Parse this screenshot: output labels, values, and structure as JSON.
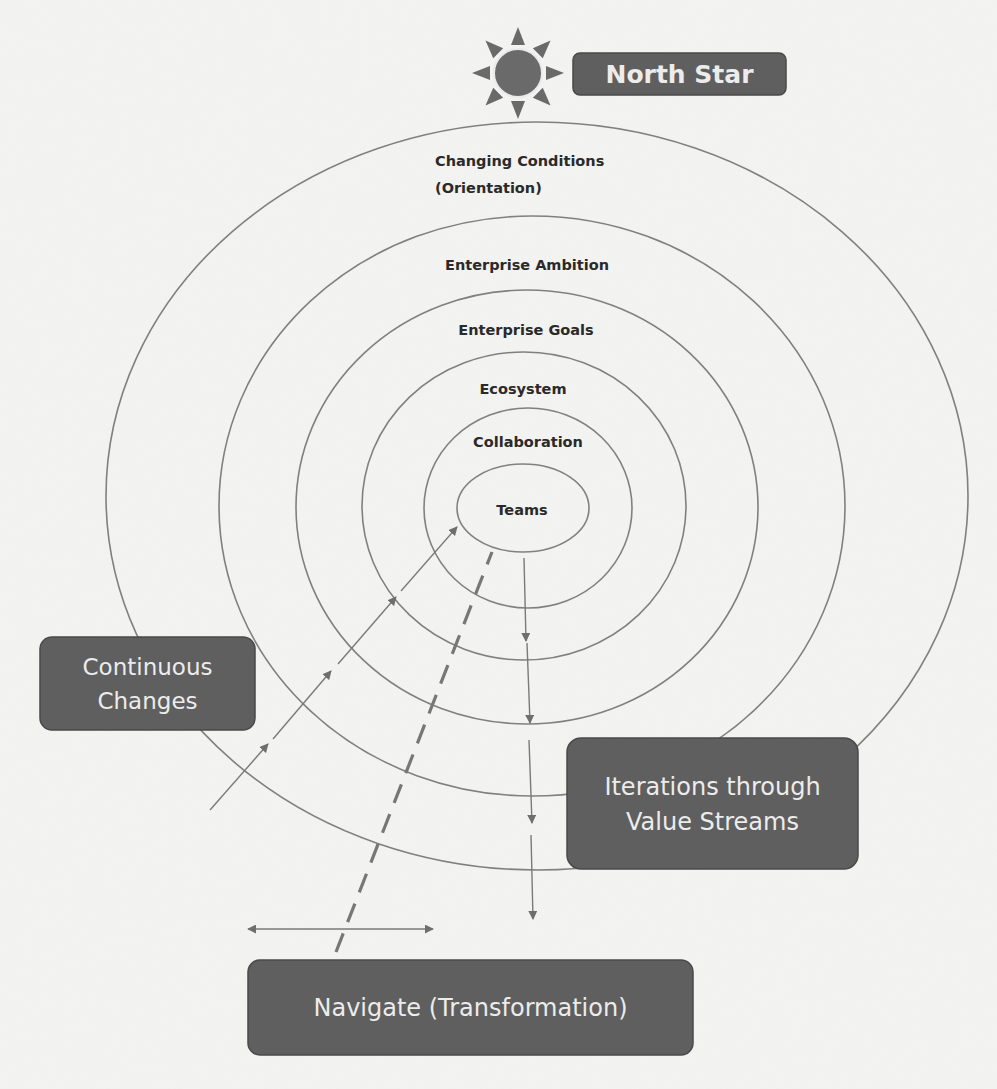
{
  "title_badge": {
    "label": "North Star",
    "icon": "sun-icon"
  },
  "rings": [
    {
      "label_lines": [
        "Changing Conditions",
        "(Orientation)"
      ]
    },
    {
      "label_lines": [
        "Enterprise Ambition"
      ]
    },
    {
      "label_lines": [
        "Enterprise Goals"
      ]
    },
    {
      "label_lines": [
        "Ecosystem"
      ]
    },
    {
      "label_lines": [
        "Collaboration"
      ]
    },
    {
      "label_lines": [
        "Teams"
      ]
    }
  ],
  "boxes": {
    "continuous_changes": {
      "lines": [
        "Continuous",
        "Changes"
      ]
    },
    "iterations": {
      "lines": [
        "Iterations through",
        "Value Streams"
      ]
    },
    "navigate": {
      "lines": [
        "Navigate (Transformation)"
      ]
    }
  },
  "colors": {
    "box_fill": "#5f5f5f",
    "box_text": "#ececec",
    "ring_stroke": "#808080",
    "label_text": "#2a2a2a",
    "background": "#f4f4f2"
  }
}
